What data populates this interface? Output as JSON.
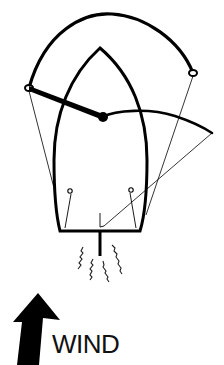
{
  "diagram": {
    "type": "sailboat-rigging-top-view",
    "labels": {
      "wind": "WIND"
    },
    "colors": {
      "stroke": "#000000",
      "background": "#ffffff"
    },
    "elements": [
      "mainsheet-traveler-arc",
      "hull",
      "mast",
      "boom",
      "sail",
      "sheets",
      "cleats",
      "rudder",
      "wake",
      "wind-arrow"
    ]
  }
}
